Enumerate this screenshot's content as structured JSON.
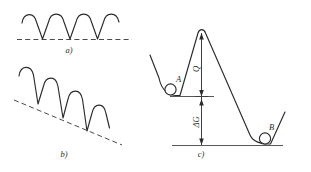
{
  "figure": {
    "background_color": "#ffffff",
    "stroke_color": "#2b2b2b",
    "dash_color": "#4a4a4a",
    "width": 311,
    "height": 172,
    "panels": [
      {
        "id": "a",
        "label": "a)",
        "description": "periodic wave on a horizontal dashed baseline",
        "baseline": "horizontal",
        "peaks": 4
      },
      {
        "id": "b",
        "label": "b)",
        "description": "periodic wave on a descending slanted dashed baseline",
        "baseline": "slanted-descending",
        "peaks": 4
      },
      {
        "id": "c",
        "label": "c)",
        "description": "energy barrier profile with wells A and B, activation energy Q and free energy change delta-G",
        "points": [
          {
            "name": "A",
            "label": "A",
            "position": "left-well"
          },
          {
            "name": "B",
            "label": "B",
            "position": "right-well"
          }
        ],
        "arrows": [
          {
            "name": "activation-energy",
            "label": "Q",
            "orientation": "vertical"
          },
          {
            "name": "free-energy-change",
            "label": "ΔG",
            "orientation": "vertical"
          }
        ]
      }
    ]
  }
}
